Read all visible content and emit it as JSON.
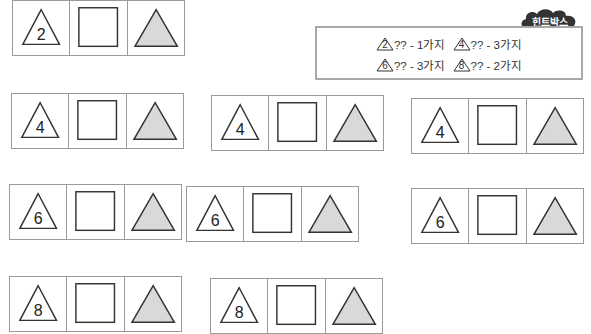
{
  "hint_box": {
    "title": "힌트박스",
    "lines": [
      [
        {
          "triangle": "2",
          "text": "?? - 1가지"
        },
        {
          "triangle": "4",
          "text": "?? - 3가지"
        }
      ],
      [
        {
          "triangle": "6",
          "text": "?? - 3가지"
        },
        {
          "triangle": "8",
          "text": "?? - 2가지"
        }
      ]
    ]
  },
  "colors": {
    "border": "#9a9a9a",
    "outline": "#333333",
    "filled_triangle": "#d9d9d9",
    "cloud": "#333333"
  },
  "rows": [
    {
      "strips": [
        {
          "number": "2"
        }
      ]
    },
    {
      "strips": [
        {
          "number": "4"
        },
        {
          "number": "4"
        },
        {
          "number": "4"
        }
      ]
    },
    {
      "strips": [
        {
          "number": "6"
        },
        {
          "number": "6"
        },
        {
          "number": "6"
        }
      ]
    },
    {
      "strips": [
        {
          "number": "8"
        },
        {
          "number": "8"
        }
      ]
    }
  ]
}
